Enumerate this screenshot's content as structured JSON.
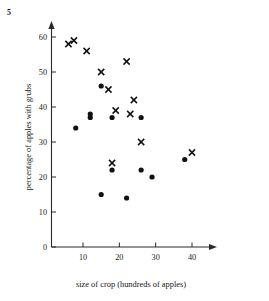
{
  "question_number": "5",
  "chart_data": {
    "type": "scatter",
    "title": "",
    "xlabel": "size of crop (hundreds of apples)",
    "ylabel": "percentage of apples with grubs",
    "xlim": [
      0,
      44
    ],
    "ylim": [
      0,
      64
    ],
    "xticks": [
      10,
      20,
      30,
      40
    ],
    "yticks": [
      0,
      10,
      20,
      30,
      40,
      50,
      60
    ],
    "xtick_labels": [
      "10",
      "20",
      "30",
      "40"
    ],
    "ytick_labels": [
      "0",
      "10",
      "20",
      "30",
      "40",
      "50",
      "60"
    ],
    "grid": false,
    "legend": "none",
    "series": [
      {
        "name": "crosses",
        "marker": "x",
        "color": "#111111",
        "points": [
          {
            "x": 6,
            "y": 58
          },
          {
            "x": 7.5,
            "y": 59
          },
          {
            "x": 11,
            "y": 56
          },
          {
            "x": 15,
            "y": 50
          },
          {
            "x": 17,
            "y": 45
          },
          {
            "x": 22,
            "y": 53
          },
          {
            "x": 19,
            "y": 39
          },
          {
            "x": 24,
            "y": 42
          },
          {
            "x": 23,
            "y": 38
          },
          {
            "x": 26,
            "y": 30
          },
          {
            "x": 18,
            "y": 24
          },
          {
            "x": 40,
            "y": 27
          }
        ]
      },
      {
        "name": "dots",
        "marker": "circle",
        "color": "#111111",
        "points": [
          {
            "x": 8,
            "y": 34
          },
          {
            "x": 12,
            "y": 37
          },
          {
            "x": 12,
            "y": 38
          },
          {
            "x": 15,
            "y": 46
          },
          {
            "x": 18,
            "y": 37
          },
          {
            "x": 26,
            "y": 37
          },
          {
            "x": 18,
            "y": 22
          },
          {
            "x": 26,
            "y": 22
          },
          {
            "x": 29,
            "y": 20
          },
          {
            "x": 15,
            "y": 15
          },
          {
            "x": 22,
            "y": 14
          },
          {
            "x": 38,
            "y": 25
          }
        ]
      }
    ]
  }
}
